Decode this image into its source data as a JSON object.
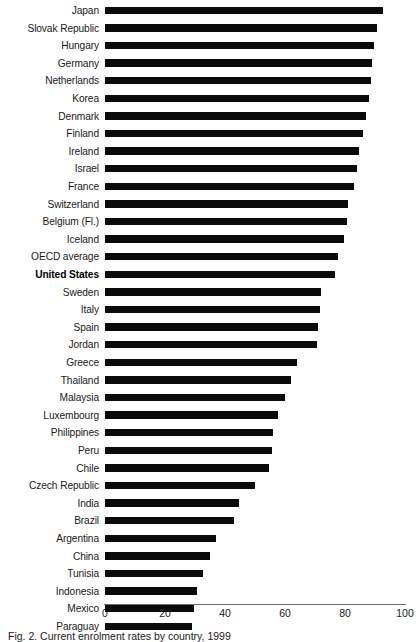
{
  "chart_data": {
    "type": "bar",
    "orientation": "horizontal",
    "title": "",
    "subtitle": "",
    "xlabel": "",
    "ylabel": "",
    "xlim": [
      0,
      100
    ],
    "ylim": null,
    "grid": false,
    "legend": null,
    "xticks": [
      0,
      20,
      40,
      60,
      80,
      100
    ],
    "xtick_labels": [
      "0",
      "20",
      "40",
      "60",
      "80",
      "100"
    ],
    "bar_color": "#0a0a0a",
    "axis_color": "#6e6e6e",
    "highlight_category": "United States",
    "categories": [
      "Japan",
      "Slovak Republic",
      "Hungary",
      "Germany",
      "Netherlands",
      "Korea",
      "Denmark",
      "Finland",
      "Ireland",
      "Israel",
      "France",
      "Switzerland",
      "Belgium (Fl.)",
      "Iceland",
      "OECD average",
      "United States",
      "Sweden",
      "Italy",
      "Spain",
      "Jordan",
      "Greece",
      "Thailand",
      "Malaysia",
      "Luxembourg",
      "Philippines",
      "Peru",
      "Chile",
      "Czech Republic",
      "India",
      "Brazil",
      "Argentina",
      "China",
      "Tunisia",
      "Indonesia",
      "Mexico",
      "Paraguay"
    ],
    "values": [
      92.5,
      90.5,
      89.5,
      89.0,
      88.5,
      88.0,
      87.0,
      86.0,
      84.5,
      84.0,
      83.0,
      81.0,
      80.5,
      79.5,
      77.5,
      76.5,
      72.0,
      71.5,
      71.0,
      70.5,
      64.0,
      62.0,
      60.0,
      57.5,
      56.0,
      55.5,
      54.5,
      50.0,
      44.5,
      43.0,
      37.0,
      35.0,
      32.5,
      30.5,
      29.5,
      29.0
    ]
  },
  "caption": {
    "text": "Fig. 2. Current enrolment rates by country, 1999"
  }
}
